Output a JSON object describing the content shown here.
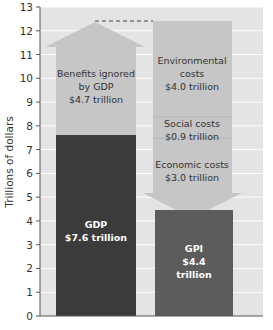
{
  "chart_data": {
    "type": "bar",
    "title": "",
    "xlabel": "",
    "ylabel": "Trillions of dollars",
    "ylim": [
      0,
      13
    ],
    "yticks": [
      0,
      1,
      2,
      3,
      4,
      5,
      6,
      7,
      8,
      9,
      10,
      11,
      12,
      13
    ],
    "grid": true,
    "categories": [
      "GDP",
      "GPI"
    ],
    "series": [
      {
        "name": "GDP",
        "value": 7.6,
        "label": "GDP",
        "value_label": "$7.6 trillion"
      },
      {
        "name": "Benefits ignored by GDP",
        "value": 4.7,
        "base": 7.6,
        "direction": "up",
        "label_lines": [
          "Benefits ignored",
          "by GDP",
          "$4.7 trillion"
        ]
      },
      {
        "name": "Environmental costs",
        "value": 4.0,
        "direction": "down",
        "label_lines": [
          "Environmental",
          "costs",
          "$4.0 trillion"
        ]
      },
      {
        "name": "Social costs",
        "value": 0.9,
        "direction": "down",
        "label_lines": [
          "Social costs",
          "$0.9 trillion"
        ]
      },
      {
        "name": "Economic costs",
        "value": 3.0,
        "direction": "down",
        "label_lines": [
          "Economic costs",
          "$3.0 trillion"
        ]
      },
      {
        "name": "GPI",
        "value": 4.4,
        "label_lines": [
          "GPI",
          "$4.4",
          "trillion"
        ]
      }
    ],
    "annotations": [
      "dashed line at 12.3 connecting benefits arrow tip to cost arrow top"
    ]
  },
  "colors": {
    "plot_bg": "#e4e4e4",
    "grid": "#ffffff",
    "arrow_fill": "#c6c6c6",
    "gdp_bar": "#3b3b3b",
    "gpi_bar": "#5c5c5c"
  }
}
